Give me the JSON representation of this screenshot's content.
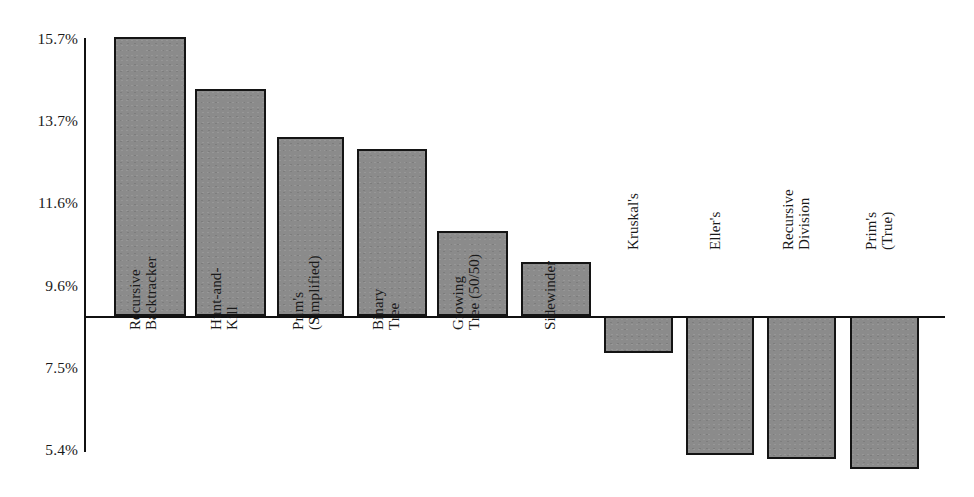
{
  "chart_data": {
    "type": "bar",
    "title": "",
    "subtitle": "",
    "xlabel": "",
    "ylabel": "",
    "grid": false,
    "legend": "none",
    "baseline_value": 8.55,
    "ylim": [
      5.4,
      15.7
    ],
    "y_ticks": [
      "15.7%",
      "13.7%",
      "11.6%",
      "9.6%",
      "7.5%",
      "5.4%"
    ],
    "y_tick_values": [
      15.7,
      13.7,
      11.6,
      9.6,
      7.5,
      5.4
    ],
    "categories": [
      "Recursive Backtracker",
      "Hunt-and-Kill",
      "Prim's (Simplified)",
      "Binary Tree",
      "Growing Tree (50/50)",
      "Sidewinder",
      "Kruskal's",
      "Eller's",
      "Recursive Division",
      "Prim's (True)"
    ],
    "category_lines": [
      [
        "Recursive",
        "Backtracker"
      ],
      [
        "Hunt-and-",
        "Kill"
      ],
      [
        "Prim's",
        "(Simplified)"
      ],
      [
        "Binary",
        "Tree"
      ],
      [
        "Growing",
        "Tree (50/50)"
      ],
      [
        "Sidewinder"
      ],
      [
        "Kruskal's"
      ],
      [
        "Eller's"
      ],
      [
        "Recursive",
        "Division"
      ],
      [
        "Prim's",
        "(True)"
      ]
    ],
    "values": [
      15.7,
      14.5,
      13.3,
      13.1,
      11.0,
      10.2,
      7.9,
      5.4,
      5.3,
      5.1
    ],
    "colors": {
      "bar_fill": "#8b8b8b",
      "bar_stroke": "#141414",
      "axis": "#111111",
      "text": "#1a1a1a",
      "background": "#ffffff"
    }
  },
  "geometry": {
    "axis_x": 84,
    "axis_top": 38,
    "axis_bottom": 452,
    "baseline_y": 316,
    "x_axis_right": 945,
    "bars": [
      {
        "left": 114,
        "width": 72,
        "top": 37,
        "height": 279,
        "dir": "up"
      },
      {
        "left": 195,
        "width": 71,
        "top": 89,
        "height": 227,
        "dir": "up"
      },
      {
        "left": 277,
        "width": 67,
        "top": 137,
        "height": 179,
        "dir": "up"
      },
      {
        "left": 357,
        "width": 70,
        "top": 149,
        "height": 167,
        "dir": "up"
      },
      {
        "left": 437,
        "width": 71,
        "top": 231,
        "height": 85,
        "dir": "up"
      },
      {
        "left": 521,
        "width": 70,
        "top": 262,
        "height": 54,
        "dir": "up"
      },
      {
        "left": 604,
        "width": 69,
        "top": 316,
        "height": 37,
        "dir": "down"
      },
      {
        "left": 686,
        "width": 68,
        "top": 316,
        "height": 139,
        "dir": "down"
      },
      {
        "left": 767,
        "width": 69,
        "top": 316,
        "height": 143,
        "dir": "down"
      },
      {
        "left": 850,
        "width": 69,
        "top": 316,
        "height": 153,
        "dir": "down"
      }
    ],
    "y_tick_label_y": [
      39,
      121,
      203,
      286,
      368,
      450
    ],
    "cat_label_anchor": [
      {
        "x": 128,
        "y": 330,
        "two": true
      },
      {
        "x": 209,
        "y": 330,
        "two": true
      },
      {
        "x": 291,
        "y": 330,
        "two": true
      },
      {
        "x": 371,
        "y": 330,
        "two": true
      },
      {
        "x": 451,
        "y": 330,
        "two": true
      },
      {
        "x": 543,
        "y": 330,
        "two": false
      },
      {
        "x": 626,
        "y": 250,
        "two": false
      },
      {
        "x": 708,
        "y": 250,
        "two": false
      },
      {
        "x": 781,
        "y": 250,
        "two": true
      },
      {
        "x": 864,
        "y": 250,
        "two": true
      }
    ]
  }
}
